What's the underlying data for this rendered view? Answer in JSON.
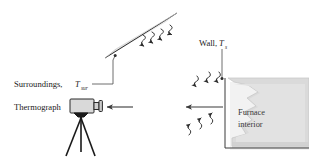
{
  "figure": {
    "background_color": "#ffffff",
    "width": 309,
    "height": 164
  },
  "labels": {
    "surroundings": {
      "text": "Surroundings,",
      "symbol": "T",
      "subscript": "sur"
    },
    "thermograph": {
      "text": "Thermograph"
    },
    "wall": {
      "text": "Wall,",
      "symbol": "T",
      "subscript": "s"
    },
    "furnace": {
      "line1": "Furnace",
      "line2": "interior"
    }
  },
  "colors": {
    "ink": "#2b2b2b",
    "text": "#1a1a1a",
    "surroundings_bar_fill": "#e3e3e3",
    "surroundings_bar_stroke": "#3a3a3a",
    "camera_body_fill": "#d9d9d9",
    "camera_stroke": "#2b2b2b",
    "wall_fill": "#dcdcdc",
    "wall_shadow": "#c9c9c9",
    "wall_stroke": "#b8b8b8",
    "arrow": "#2b2b2b",
    "leader": "#4a4a4a"
  },
  "elements": {
    "surroundings_bar": {
      "name": "surroundings-surface",
      "description": "tilted gray bar representing surroundings"
    },
    "wall_block": {
      "name": "furnace-wall-block",
      "description": "stepped gray block representing furnace wall and interior"
    },
    "camera": {
      "name": "thermograph-camera",
      "description": "camera body with lens mounted on tripod"
    },
    "wavy_arrows_surroundings": {
      "count": 4,
      "direction": "down"
    },
    "wavy_arrows_wall_upper": {
      "count": 3,
      "direction": "down-left"
    },
    "wavy_arrows_wall_lower": {
      "count": 3,
      "direction": "up-right"
    },
    "straight_arrow_left_near_camera": {
      "direction": "left"
    },
    "straight_arrow_left_near_wall": {
      "direction": "left"
    }
  }
}
